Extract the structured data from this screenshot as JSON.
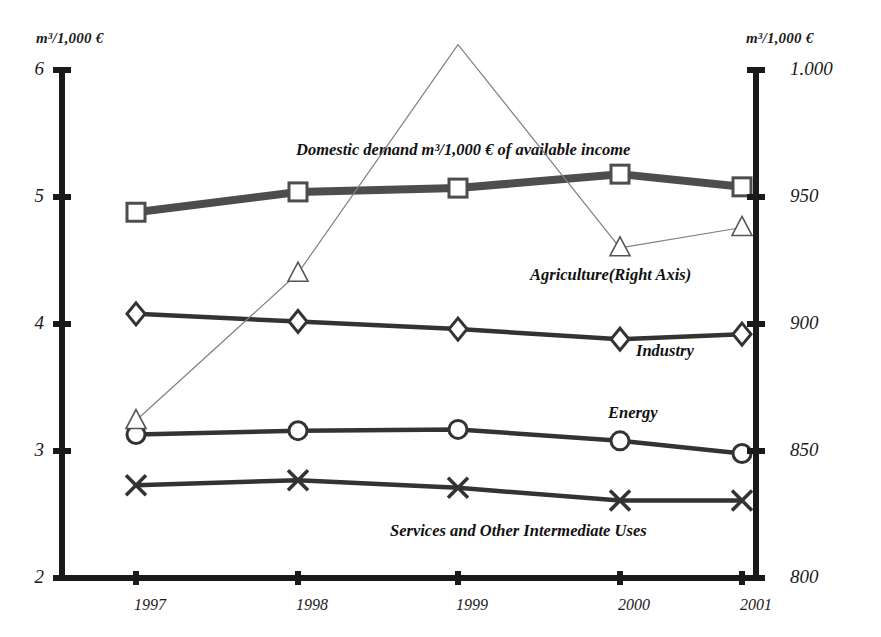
{
  "axes": {
    "left_unit": "m³/1,000 €",
    "right_unit": "m³/1,000 €",
    "left_ticks": [
      "6",
      "5",
      "4",
      "3",
      "2"
    ],
    "right_ticks": [
      "1.000",
      "950",
      "900",
      "850",
      "800"
    ],
    "x_ticks": [
      "1997",
      "1998",
      "1999",
      "2000",
      "2001"
    ]
  },
  "labels": {
    "domestic_demand": "Domestic demand m³/1,000 € of available income",
    "agriculture": "Agriculture(Right Axis)",
    "industry": "Industry",
    "energy": "Energy",
    "services": "Services and Other Intermediate Uses"
  },
  "colors": {
    "thick_line": "#4d4d4d",
    "medium_line": "#333333",
    "thin_line": "#808080",
    "axis": "#1a1a1a",
    "marker_fill": "#ffffff"
  },
  "chart_data": {
    "type": "line",
    "title": "",
    "xlabel": "",
    "ylabel": "m³/1,000 €",
    "y2label": "m³/1,000 €",
    "categories": [
      "1997",
      "1998",
      "1999",
      "2000",
      "2001"
    ],
    "ylim": [
      2,
      6
    ],
    "y2lim": [
      800,
      1000
    ],
    "grid": false,
    "legend": "inline-annotations",
    "series": [
      {
        "name": "Domestic demand m³/1,000 € of available income",
        "axis": "left",
        "marker": "square",
        "line": "thick",
        "values": [
          4.88,
          5.04,
          5.07,
          5.18,
          5.08
        ]
      },
      {
        "name": "Industry",
        "axis": "left",
        "marker": "diamond",
        "line": "medium",
        "values": [
          4.08,
          4.02,
          3.96,
          3.88,
          3.92
        ]
      },
      {
        "name": "Energy",
        "axis": "left",
        "marker": "circle",
        "line": "medium",
        "values": [
          3.13,
          3.16,
          3.17,
          3.08,
          2.98
        ]
      },
      {
        "name": "Services and Other Intermediate Uses",
        "axis": "left",
        "marker": "cross",
        "line": "medium",
        "values": [
          2.73,
          2.77,
          2.71,
          2.61,
          2.61
        ]
      },
      {
        "name": "Agriculture(Right Axis)",
        "axis": "right",
        "marker": "triangle",
        "line": "thin",
        "values": [
          862,
          920,
          1010,
          930,
          938
        ]
      }
    ]
  }
}
